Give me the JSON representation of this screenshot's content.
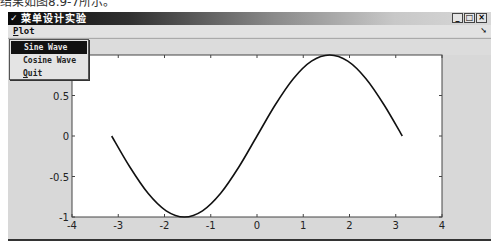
{
  "page_caption": "结果如图8.9-7所示。",
  "window": {
    "title": "菜单设计实验",
    "title_icon": "matlab-figure-icon",
    "controls": {
      "minimize": "_",
      "maximize": "□",
      "close": "×"
    }
  },
  "menubar": {
    "menus": [
      {
        "label": "Plot",
        "mnemonic": "P"
      }
    ],
    "dock_icon": "dock-arrow-icon"
  },
  "dropdown": {
    "items": [
      {
        "label": "Sine Wave",
        "selected": true
      },
      {
        "label": "Cosine Wave",
        "selected": false
      },
      {
        "label": "Quit",
        "mnemonic": "Q",
        "selected": false
      }
    ]
  },
  "chart_data": {
    "type": "line",
    "title": "",
    "xlabel": "",
    "ylabel": "",
    "xlim": [
      -4,
      4
    ],
    "ylim": [
      -1,
      1
    ],
    "xticks": [
      -4,
      -3,
      -2,
      -1,
      0,
      1,
      2,
      3,
      4
    ],
    "yticks": [
      -1,
      -0.5,
      0,
      0.5
    ],
    "xtick_labels": [
      "-4",
      "-3",
      "-2",
      "-1",
      "0",
      "1",
      "2",
      "3",
      "4"
    ],
    "ytick_labels": [
      "-1",
      "-0.5",
      "0",
      "0.5"
    ],
    "grid": false,
    "legend": null,
    "series": [
      {
        "name": "sin(x)",
        "color": "#111111",
        "x": [
          -3.1416,
          -2.7489,
          -2.3562,
          -1.9635,
          -1.5708,
          -1.1781,
          -0.7854,
          -0.3927,
          0,
          0.3927,
          0.7854,
          1.1781,
          1.5708,
          1.9635,
          2.3562,
          2.7489,
          3.1416
        ],
        "y": [
          0,
          -0.3827,
          -0.7071,
          -0.9239,
          -1,
          -0.9239,
          -0.7071,
          -0.3827,
          0,
          0.3827,
          0.7071,
          0.9239,
          1,
          0.9239,
          0.7071,
          0.3827,
          0
        ]
      }
    ]
  }
}
